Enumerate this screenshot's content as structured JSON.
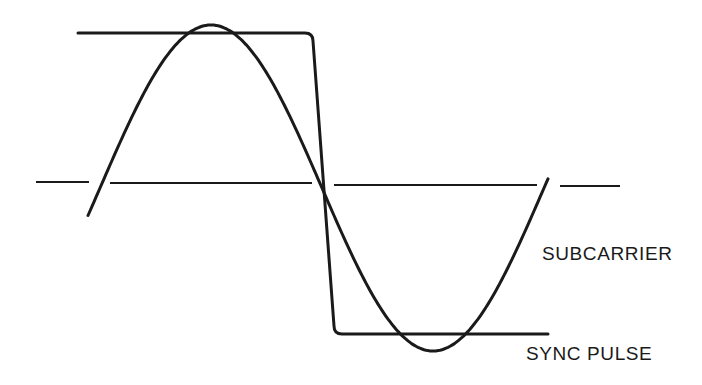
{
  "diagram": {
    "title": "",
    "labels": {
      "subcarrier": "SUBCARRIER",
      "sync_pulse": "SYNC PULSE"
    },
    "colors": {
      "background": "#ffffff",
      "stroke": "#1a1a1a"
    },
    "axis": {
      "style": "dashed",
      "segments": [
        [
          [
            36,
            182
          ],
          [
            89,
            182
          ]
        ],
        [
          [
            110,
            183
          ],
          [
            312,
            183
          ]
        ],
        [
          [
            334,
            185
          ],
          [
            537,
            185
          ]
        ],
        [
          [
            560,
            186
          ],
          [
            620,
            186
          ]
        ]
      ]
    },
    "subcarrier": {
      "type": "sine",
      "x_start": 88,
      "x_end": 549,
      "zero_crossing_x": 322,
      "center_y": 188,
      "amplitude": 163,
      "half_period": 222
    },
    "sync_pulse": {
      "top_level_y": 33,
      "bottom_level_y": 334,
      "start_x": 78,
      "fall_start_x": 313,
      "fall_end_x": 334,
      "end_x": 548
    }
  }
}
